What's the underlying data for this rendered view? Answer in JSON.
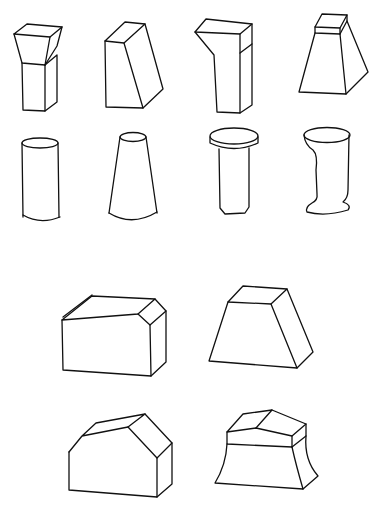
{
  "figure": {
    "background": "#ffffff",
    "stroke_color": "#111111",
    "layout": "two groups: 2 rows x 4 columns of small solids on top, 2 rows x 2 columns of larger solids below",
    "text_labels": []
  },
  "shapes": [
    {
      "id": 1,
      "name": "prism-with-flared-top",
      "row": 1,
      "col": 1,
      "group": "top"
    },
    {
      "id": 2,
      "name": "oblique-truncated-prism",
      "row": 1,
      "col": 2,
      "group": "top"
    },
    {
      "id": 3,
      "name": "l-shaped-prism",
      "row": 1,
      "col": 3,
      "group": "top"
    },
    {
      "id": 4,
      "name": "frustum-with-cap-block",
      "row": 1,
      "col": 4,
      "group": "top"
    },
    {
      "id": 5,
      "name": "cylinder",
      "row": 2,
      "col": 1,
      "group": "top"
    },
    {
      "id": 6,
      "name": "cone-frustum",
      "row": 2,
      "col": 2,
      "group": "top"
    },
    {
      "id": 7,
      "name": "cylinder-with-disc-cap",
      "row": 2,
      "col": 3,
      "group": "top"
    },
    {
      "id": 8,
      "name": "curved-profile-cylinder",
      "row": 2,
      "col": 4,
      "group": "top"
    },
    {
      "id": 9,
      "name": "box-with-chamfered-edge",
      "row": 1,
      "col": 1,
      "group": "bottom"
    },
    {
      "id": 10,
      "name": "trapezoidal-prism",
      "row": 1,
      "col": 2,
      "group": "bottom"
    },
    {
      "id": 11,
      "name": "house-shaped-prism",
      "row": 2,
      "col": 1,
      "group": "bottom"
    },
    {
      "id": 12,
      "name": "faceted-cap-flared-block",
      "row": 2,
      "col": 2,
      "group": "bottom"
    }
  ]
}
